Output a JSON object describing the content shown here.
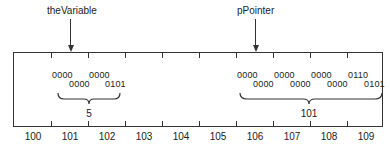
{
  "labels": {
    "variable_name": "theVariable",
    "pointer_name": "pPointer"
  },
  "addresses": [
    "100",
    "101",
    "102",
    "103",
    "104",
    "105",
    "106",
    "107",
    "108",
    "109"
  ],
  "variable": {
    "bits_top": [
      "0000",
      "0000"
    ],
    "bits_bottom": [
      "0000",
      "0101"
    ],
    "value": "5"
  },
  "pointer": {
    "bits_top": [
      "0000",
      "0000",
      "0000",
      "0110"
    ],
    "bits_bottom": [
      "0000",
      "0000",
      "0000",
      "0101"
    ],
    "value": "101"
  }
}
